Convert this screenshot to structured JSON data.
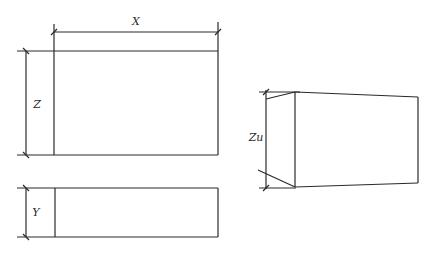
{
  "diagram": {
    "title": "",
    "views": [
      {
        "id": "front-view",
        "description": "Rectangle with horizontal dimension X and vertical dimension Z",
        "dimensions": [
          {
            "label": "X",
            "orientation": "horizontal"
          },
          {
            "label": "Z",
            "orientation": "vertical"
          }
        ]
      },
      {
        "id": "top-view",
        "description": "Narrow rectangle with vertical dimension Y",
        "dimensions": [
          {
            "label": "Y",
            "orientation": "vertical"
          }
        ]
      },
      {
        "id": "perspective-view",
        "description": "Box in perspective with vertical dimension Zu",
        "dimensions": [
          {
            "label": "Zu",
            "orientation": "vertical"
          }
        ]
      }
    ]
  },
  "labels": {
    "x": "X",
    "z": "Z",
    "y": "Y",
    "zu": "Zu"
  },
  "colors": {
    "line": "#2a2a2a",
    "background": "#ffffff"
  }
}
